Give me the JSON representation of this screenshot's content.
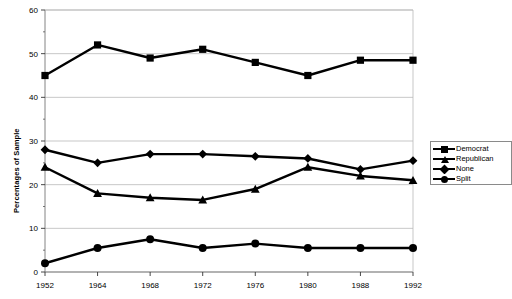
{
  "chart_data": {
    "type": "line",
    "title": "",
    "xlabel": "",
    "ylabel": "Percentages of Sample",
    "categories": [
      "1952",
      "1964",
      "1968",
      "1972",
      "1976",
      "1980",
      "1988",
      "1992"
    ],
    "ylim": [
      0,
      60
    ],
    "yticks": [
      0,
      10,
      20,
      30,
      40,
      50,
      60
    ],
    "ytick_labels": [
      "0",
      "10",
      "20",
      "30",
      "40",
      "50",
      "60"
    ],
    "grid": true,
    "legend_position": "right",
    "series": [
      {
        "name": "Democrat",
        "marker": "square",
        "values": [
          45,
          52,
          49,
          51,
          48,
          45,
          48.5,
          48.5
        ]
      },
      {
        "name": "Republican",
        "marker": "triangle",
        "values": [
          24,
          18,
          17,
          16.5,
          19,
          24,
          22,
          21
        ]
      },
      {
        "name": "None",
        "marker": "diamond",
        "values": [
          28,
          25,
          27,
          27,
          26.5,
          26,
          23.5,
          25.5
        ]
      },
      {
        "name": "Split",
        "marker": "circle",
        "values": [
          2,
          5.5,
          7.5,
          5.5,
          6.5,
          5.5,
          5.5,
          5.5
        ]
      }
    ]
  },
  "legend": {
    "items": [
      {
        "label": "Democrat"
      },
      {
        "label": "Republican"
      },
      {
        "label": "None"
      },
      {
        "label": "Split"
      }
    ]
  }
}
